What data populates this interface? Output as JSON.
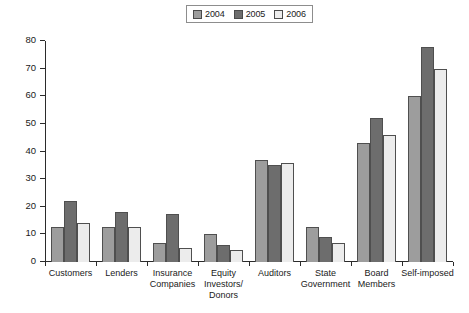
{
  "chart_data": {
    "type": "bar",
    "title": "",
    "xlabel": "",
    "ylabel": "",
    "ylim": [
      0,
      80
    ],
    "yticks": [
      0,
      10,
      20,
      30,
      40,
      50,
      60,
      70,
      80
    ],
    "grid": false,
    "legend_position": "top-center",
    "categories": [
      "Customers",
      "Lenders",
      "Insurance\nCompanies",
      "Equity\nInvestors/\nDonors",
      "Auditors",
      "State\nGovernment",
      "Board\nMembers",
      "Self-imposed"
    ],
    "series": [
      {
        "name": "2004",
        "color": "#9d9d9d",
        "values": [
          12.5,
          12.5,
          7,
          10,
          37,
          12.5,
          43,
          60
        ]
      },
      {
        "name": "2005",
        "color": "#6d6d6d",
        "values": [
          22,
          18,
          17.5,
          6,
          35,
          9,
          52,
          78
        ]
      },
      {
        "name": "2006",
        "color": "#ececec",
        "values": [
          14,
          12.5,
          5,
          4.5,
          36,
          7,
          46,
          70
        ]
      }
    ]
  },
  "legend": {
    "items": [
      {
        "label": "2004",
        "icon": "legend-swatch-2004"
      },
      {
        "label": "2005",
        "icon": "legend-swatch-2005"
      },
      {
        "label": "2006",
        "icon": "legend-swatch-2006"
      }
    ]
  }
}
